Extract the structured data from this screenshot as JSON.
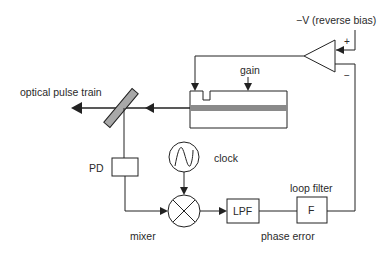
{
  "diagram": {
    "type": "block-diagram",
    "title": "",
    "labels": {
      "bias": "−V (reverse bias)",
      "plus": "+",
      "minus": "−",
      "gain": "gain",
      "optical_output": "optical pulse train",
      "pd": "PD",
      "clock": "clock",
      "mixer": "mixer",
      "lpf": "LPF",
      "loop_filter": "loop filter",
      "filter_block": "F",
      "phase_error": "phase error"
    },
    "components": [
      {
        "id": "amplifier",
        "kind": "differential-amplifier"
      },
      {
        "id": "laser",
        "kind": "mode-locked-laser",
        "sections": [
          "absorber",
          "gain"
        ]
      },
      {
        "id": "beam-splitter",
        "kind": "mirror"
      },
      {
        "id": "photodetector",
        "kind": "box",
        "label": "PD"
      },
      {
        "id": "clock-source",
        "kind": "sine-source",
        "label": "clock"
      },
      {
        "id": "mixer",
        "kind": "multiplier",
        "label": "mixer"
      },
      {
        "id": "lpf",
        "kind": "box",
        "label": "LPF"
      },
      {
        "id": "loop-filter",
        "kind": "box",
        "label": "F"
      }
    ],
    "connections": [
      [
        "laser",
        "beam-splitter"
      ],
      [
        "beam-splitter",
        "optical-output"
      ],
      [
        "beam-splitter",
        "photodetector"
      ],
      [
        "photodetector",
        "mixer"
      ],
      [
        "clock-source",
        "mixer"
      ],
      [
        "mixer",
        "lpf"
      ],
      [
        "lpf",
        "loop-filter"
      ],
      [
        "loop-filter",
        "amplifier(-)"
      ],
      [
        "bias",
        "amplifier(+)"
      ],
      [
        "amplifier",
        "laser(absorber)"
      ]
    ],
    "colors": {
      "line": "#222222",
      "mirror_fill": "#a8a8a8",
      "gain_stripe": "#8a8a8a"
    }
  }
}
